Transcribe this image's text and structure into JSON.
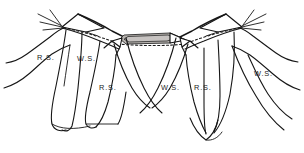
{
  "figure": {
    "type": "anatomical-line-drawing",
    "background_color": "#ffffff",
    "ink_color": "#161616",
    "shading_color": "#b8b4b0",
    "width": 304,
    "height": 153
  },
  "labels": [
    {
      "id": "label-1",
      "text": "R.S.",
      "x": 37,
      "y": 54
    },
    {
      "id": "label-2",
      "text": "W.S.",
      "x": 77,
      "y": 55
    },
    {
      "id": "label-3",
      "text": "R.S.",
      "x": 99,
      "y": 84
    },
    {
      "id": "label-4",
      "text": "W.S.",
      "x": 161,
      "y": 84
    },
    {
      "id": "label-5",
      "text": "R.S.",
      "x": 194,
      "y": 84
    },
    {
      "id": "label-6",
      "text": "W.S.",
      "x": 254,
      "y": 70
    }
  ],
  "legend": {
    "ws_meaning": "W.S.",
    "rs_meaning": "R.S."
  }
}
